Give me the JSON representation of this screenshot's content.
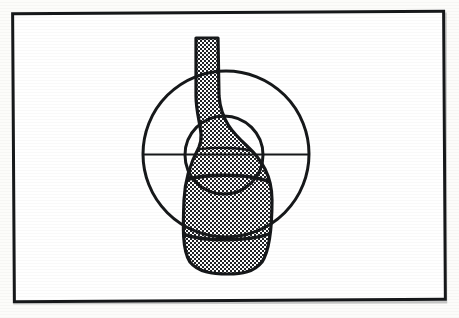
{
  "figure": {
    "title": "",
    "caption": "",
    "frame": {
      "border_color": "#16181a",
      "background_color": "#ffffff",
      "border_width_px": 3,
      "x": 12,
      "y": 11,
      "width": 428,
      "height": 285
    },
    "page_background_color": "#fcfcfa",
    "ink_color": "#16181a",
    "fill_pattern": "checkerboard-dither-50",
    "fill_pattern_colors": {
      "ink": "#1a1c1e",
      "paper": "#ffffff"
    }
  },
  "diagram_data": {
    "type": "line-art-overlay",
    "subject": "bottle-vessel-profile",
    "description": "Shaded bottle/vessel silhouette overlaid with two concentric-family circles and a horizontal diameter line",
    "shapes": [
      {
        "name": "vessel-silhouette",
        "kind": "filled-outline",
        "fill": "checkerboard-dither-50",
        "stroke": "#16181a",
        "stroke_width_px": 3,
        "neck": {
          "top_y": 38,
          "left_x": 196,
          "right_x": 218,
          "width_px": 22
        },
        "shoulder_y": 150,
        "body": {
          "left_x": 183,
          "right_x": 272,
          "max_width_px": 89
        },
        "base_y": 273,
        "total_height_px": 235
      },
      {
        "name": "large-circle",
        "kind": "circle",
        "stroke": "#16181a",
        "stroke_width_px": 3,
        "cx": 226,
        "cy": 154,
        "r": 83
      },
      {
        "name": "small-circle",
        "kind": "circle",
        "stroke": "#16181a",
        "stroke_width_px": 3,
        "cx": 224,
        "cy": 155,
        "r": 39
      },
      {
        "name": "horizontal-diameter-line",
        "kind": "line",
        "stroke": "#16181a",
        "stroke_width_px": 2,
        "x1": 143,
        "y1": 154,
        "x2": 310,
        "y2": 154
      }
    ],
    "counts": {
      "circles": 2,
      "lines": 1,
      "filled_regions": 1,
      "body_division_arcs": 3
    }
  }
}
